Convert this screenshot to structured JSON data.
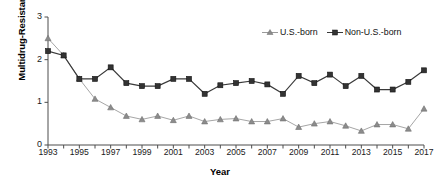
{
  "chart_data": {
    "type": "line",
    "title": "",
    "xlabel": "Year",
    "ylabel": "Multidrug-Resistant (%)",
    "xlim": [
      1993,
      2017
    ],
    "ylim": [
      0,
      3
    ],
    "yticks": [
      "0",
      "1",
      "2",
      "3"
    ],
    "ytick_values": [
      0,
      1,
      2,
      3
    ],
    "xticks": [
      "1993",
      "1995",
      "1997",
      "1999",
      "2001",
      "2003",
      "2005",
      "2007",
      "2009",
      "2011",
      "2013",
      "2015",
      "2017"
    ],
    "xtick_values": [
      1993,
      1995,
      1997,
      1999,
      2001,
      2003,
      2005,
      2007,
      2009,
      2011,
      2013,
      2015,
      2017
    ],
    "x": [
      1993,
      1994,
      1995,
      1996,
      1997,
      1998,
      1999,
      2000,
      2001,
      2002,
      2003,
      2004,
      2005,
      2006,
      2007,
      2008,
      2009,
      2010,
      2011,
      2012,
      2013,
      2014,
      2015,
      2016,
      2017
    ],
    "grid": false,
    "legend_position": "top-right",
    "series": [
      {
        "name": "U.S.-born",
        "marker": "triangle",
        "color": "#8c8c8c",
        "line_color": "#a6a6a6",
        "values": [
          2.5,
          2.1,
          1.55,
          1.08,
          0.88,
          0.68,
          0.6,
          0.68,
          0.58,
          0.68,
          0.55,
          0.6,
          0.62,
          0.55,
          0.55,
          0.62,
          0.42,
          0.5,
          0.55,
          0.45,
          0.33,
          0.48,
          0.48,
          0.38,
          0.85
        ]
      },
      {
        "name": "Non-U.S.-born",
        "marker": "square",
        "color": "#333333",
        "line_color": "#3a3a3a",
        "values": [
          2.2,
          2.1,
          1.55,
          1.55,
          1.82,
          1.45,
          1.38,
          1.38,
          1.55,
          1.55,
          1.2,
          1.4,
          1.45,
          1.5,
          1.42,
          1.2,
          1.62,
          1.45,
          1.65,
          1.38,
          1.62,
          1.3,
          1.3,
          1.48,
          1.75
        ]
      }
    ]
  },
  "legend": {
    "items": [
      {
        "label": "U.S.-born",
        "marker": "triangle"
      },
      {
        "label": "Non-U.S.-born",
        "marker": "square"
      }
    ]
  },
  "caption": ""
}
